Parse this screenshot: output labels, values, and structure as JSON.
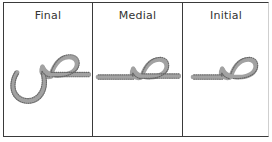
{
  "figure": {
    "kind": "arabic-letterform-table",
    "letter": "ص",
    "letter_name": "Sad",
    "stroke_fill_color": "#a2a2a2",
    "stroke_outline_color": "#646464",
    "border_color": "#3a3a3a",
    "background_color": "#ffffff"
  },
  "table": {
    "columns": [
      {
        "key": "final",
        "header": "Final",
        "glyph_name": "sad-final-form",
        "description": "Arabic letter Sad in final position: connecting line from the right, oval loop, and a deep curved descending tail"
      },
      {
        "key": "medial",
        "header": "Medial",
        "glyph_name": "sad-medial-form",
        "description": "Arabic letter Sad in medial position: connecting baseline on both sides with an oval loop above"
      },
      {
        "key": "initial",
        "header": "Initial",
        "glyph_name": "sad-initial-form",
        "description": "Arabic letter Sad in initial position: oval loop with a connecting baseline extending to the left"
      }
    ]
  }
}
